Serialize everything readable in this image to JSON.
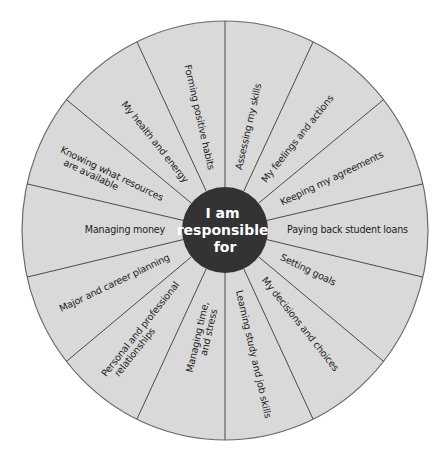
{
  "diagram": {
    "type": "wheel",
    "colors": {
      "background": "#ffffff",
      "segment_fill": "#d9d9d9",
      "spoke": "#4a4a4a",
      "rim": "#6a6a6a",
      "hub_fill": "#333333",
      "hub_text": "#ffffff",
      "label_text": "#222222"
    },
    "hub": {
      "lines": [
        "I am",
        "responsible",
        "for"
      ]
    },
    "segments": [
      {
        "label_lines": [
          "Assessing my skills"
        ]
      },
      {
        "label_lines": [
          "My feelings and actions"
        ]
      },
      {
        "label_lines": [
          "Keeping my agreements"
        ]
      },
      {
        "label_lines": [
          "Paying back student loans"
        ]
      },
      {
        "label_lines": [
          "Setting goals"
        ]
      },
      {
        "label_lines": [
          "My decisions and choices"
        ]
      },
      {
        "label_lines": [
          "Learning study and job skills"
        ]
      },
      {
        "label_lines": [
          "Managing time,",
          "and stress"
        ]
      },
      {
        "label_lines": [
          "Personal and professional",
          "relationships"
        ]
      },
      {
        "label_lines": [
          "Major and career planning"
        ]
      },
      {
        "label_lines": [
          "Managing money"
        ]
      },
      {
        "label_lines": [
          "Knowing what resources",
          "are available"
        ]
      },
      {
        "label_lines": [
          "My health and energy"
        ]
      },
      {
        "label_lines": [
          "Forming positive habits"
        ]
      }
    ]
  }
}
